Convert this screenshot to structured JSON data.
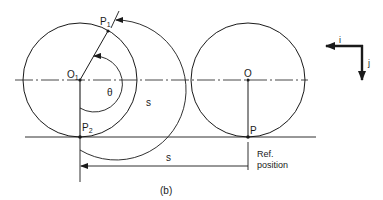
{
  "figure": {
    "caption": "(b)",
    "colors": {
      "ink": "#1a1a1a",
      "background": "#ffffff"
    },
    "left_wheel": {
      "center_label": "O",
      "center_subscript": "1",
      "contact_label": "P",
      "contact_subscript": "2",
      "rotated_point_label": "P",
      "rotated_point_subscript": "1",
      "angle_label": "θ",
      "arc_length_label": "s"
    },
    "right_wheel": {
      "center_label": "O",
      "contact_label": "P",
      "ref_label_line1": "Ref.",
      "ref_label_line2": "position"
    },
    "displacement_label": "s",
    "axes": {
      "i_label": "i",
      "j_label": "j"
    }
  }
}
